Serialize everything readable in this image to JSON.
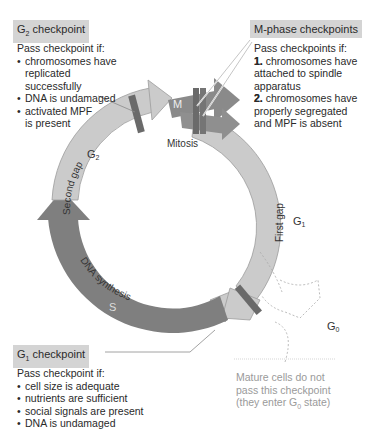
{
  "g2_checkpoint": {
    "title_main": "G",
    "title_sub": "2",
    "title_rest": " checkpoint",
    "intro": "Pass checkpoint if:",
    "items": [
      "chromosomes have replicated successfully",
      "DNA is undamaged",
      "activated MPF is present"
    ]
  },
  "m_checkpoint": {
    "title": "M-phase checkpoints",
    "intro": "Pass checkpoints if:",
    "items": [
      {
        "num": "1.",
        "text": "chromosomes have attached to spindle apparatus"
      },
      {
        "num": "2.",
        "text": "chromosomes have properly segregated and MPF is absent"
      }
    ]
  },
  "g1_checkpoint": {
    "title_main": "G",
    "title_sub": "1",
    "title_rest": " checkpoint",
    "intro": "Pass checkpoint if:",
    "items": [
      "cell size is adequate",
      "nutrients are sufficient",
      "social signals are present",
      "DNA is undamaged"
    ]
  },
  "g0_note": {
    "line1": "Mature cells do not",
    "line2": "pass this checkpoint",
    "line3_pre": "(they enter G",
    "line3_sub": "0",
    "line3_post": " state)"
  },
  "cycle": {
    "m_label": "M",
    "mitosis_label": "Mitosis",
    "g2_label": "G",
    "g2_sub": "2",
    "second_gap_label": "Second gap",
    "g1_label": "G",
    "g1_sub": "1",
    "first_gap_label": "First gap",
    "s_label": "S",
    "dna_synthesis_label": "DNA synthesis",
    "g0_label": "G",
    "g0_sub": "0"
  },
  "colors": {
    "light_phase": "#c9c9c9",
    "mid_phase": "#8c8c8c",
    "dark_phase": "#7d7d7d",
    "checkpoint_bar": "#6e6e6e",
    "title_bg": "#d4d4d4"
  }
}
